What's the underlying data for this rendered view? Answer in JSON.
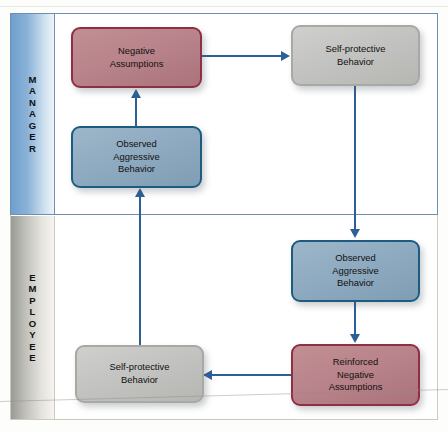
{
  "diagram": {
    "type": "swimlane-flowchart",
    "colors": {
      "red_fill": "#b9848b",
      "red_border": "#8e2f44",
      "blue_fill": "#8fabc1",
      "blue_border": "#1d5c80",
      "gray_fill": "#c3c3c1",
      "gray_border": "#a8a8a4",
      "connector": "#2d6096",
      "manager_lane_border": "#6d8fb3",
      "employee_lane_border": "#cfcabb"
    }
  },
  "lanes": [
    {
      "id": "manager",
      "label": "MANAGER",
      "letters": [
        "M",
        "A",
        "N",
        "A",
        "G",
        "E",
        "R"
      ]
    },
    {
      "id": "employee",
      "label": "EMPLOYEE",
      "letters": [
        "E",
        "M",
        "P",
        "L",
        "O",
        "Y",
        "E",
        "E"
      ]
    }
  ],
  "nodes": [
    {
      "id": "mgr-neg-assump",
      "lane": "manager",
      "color": "red",
      "text": "Negative\nAssumptions",
      "lines": [
        "Negative",
        "Assumptions"
      ]
    },
    {
      "id": "mgr-selfprot",
      "lane": "manager",
      "color": "gray",
      "text": "Self-protective\nBehavior",
      "lines": [
        "Self-protective",
        "Behavior"
      ]
    },
    {
      "id": "mgr-observed",
      "lane": "manager",
      "color": "blue",
      "text": "Observed\nAggressive\nBehavior",
      "lines": [
        "Observed",
        "Aggressive",
        "Behavior"
      ]
    },
    {
      "id": "emp-observed",
      "lane": "employee",
      "color": "blue",
      "text": "Observed\nAggressive\nBehavior",
      "lines": [
        "Observed",
        "Aggressive",
        "Behavior"
      ]
    },
    {
      "id": "emp-reinforced",
      "lane": "employee",
      "color": "red",
      "text": "Reinforced\nNegative\nAssumptions",
      "lines": [
        "Reinforced",
        "Negative",
        "Assumptions"
      ]
    },
    {
      "id": "emp-selfprot",
      "lane": "employee",
      "color": "gray",
      "text": "Self-protective\nBehavior",
      "lines": [
        "Self-protective",
        "Behavior"
      ]
    }
  ],
  "edges": [
    {
      "id": "neg-to-selfprot",
      "from": "mgr-neg-assump",
      "to": "mgr-selfprot",
      "direction": "right"
    },
    {
      "id": "selfprot-to-obs",
      "from": "mgr-selfprot",
      "to": "emp-observed",
      "direction": "down"
    },
    {
      "id": "obs-to-reinf",
      "from": "emp-observed",
      "to": "emp-reinforced",
      "direction": "down"
    },
    {
      "id": "reinf-to-selfprot",
      "from": "emp-reinforced",
      "to": "emp-selfprot",
      "direction": "left"
    },
    {
      "id": "selfprot-to-obsmgr",
      "from": "emp-selfprot",
      "to": "mgr-observed",
      "direction": "up"
    },
    {
      "id": "obsmgr-to-neg",
      "from": "mgr-observed",
      "to": "mgr-neg-assump",
      "direction": "up"
    }
  ]
}
